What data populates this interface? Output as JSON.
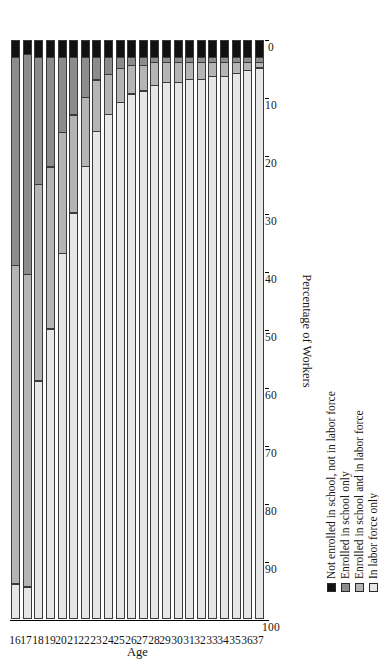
{
  "chart_data": {
    "type": "bar",
    "subtype": "stacked-bar-horizontal-rotated",
    "title": "",
    "xlabel": "Age",
    "ylabel": "Percentage of Workers",
    "ylim": [
      0,
      100
    ],
    "yticks": [
      100,
      90,
      80,
      70,
      60,
      50,
      40,
      30,
      20,
      10,
      0
    ],
    "grid": false,
    "legend_position": "right",
    "orientation": "page rotated 90 degrees counter-clockwise",
    "categories": [
      "16",
      "17",
      "18",
      "19",
      "20",
      "21",
      "22",
      "23",
      "24",
      "25",
      "26",
      "27",
      "28",
      "29",
      "30",
      "31",
      "32",
      "33",
      "34",
      "35",
      "36",
      "37"
    ],
    "series": [
      {
        "name": "Not enrolled in school, not in labor force",
        "color": "#111111",
        "values": [
          3,
          2.5,
          3,
          3,
          3,
          3,
          3,
          3,
          3,
          3,
          3,
          3,
          3,
          3,
          3,
          3,
          3,
          3,
          3,
          3,
          3,
          3
        ]
      },
      {
        "name": "Enrolled in school only",
        "color": "#8c8c8c",
        "values": [
          36,
          38,
          22,
          19,
          13,
          10,
          7,
          4,
          3,
          2,
          1.5,
          1.5,
          1,
          1,
          1,
          1,
          1,
          1,
          1,
          1,
          1,
          1
        ]
      },
      {
        "name": "Enrolled in school and in labor force",
        "color": "#b5b5b5",
        "values": [
          55,
          54,
          34,
          28,
          21,
          17,
          12,
          9,
          7,
          6,
          5,
          4.5,
          4,
          3.5,
          3.5,
          3,
          3,
          2.5,
          2.5,
          2,
          1.5,
          1
        ]
      },
      {
        "name": "In labor force only",
        "color": "#e6e6e6",
        "values": [
          6,
          5.5,
          41,
          50,
          63,
          70,
          78,
          84,
          87,
          89,
          90.5,
          91,
          92,
          92.5,
          92.5,
          93,
          93,
          93.5,
          93.5,
          94,
          94.5,
          95
        ]
      }
    ],
    "legend": [
      "Not enrolled in school, not in labor force",
      "Enrolled in school only",
      "Enrolled in school and in labor force",
      "In labor force only"
    ]
  }
}
